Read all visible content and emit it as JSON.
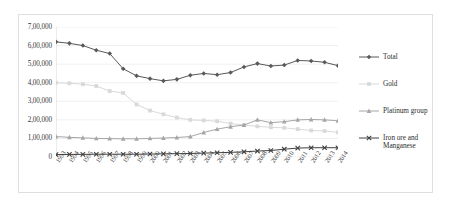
{
  "chart_data": {
    "type": "line",
    "title": "",
    "xlabel": "",
    "ylabel": "",
    "ylim": [
      0,
      700000
    ],
    "grid": true,
    "legend_position": "right",
    "number_format": "indian-lakh",
    "categories": [
      "1993",
      "1994",
      "1995",
      "1996",
      "1997",
      "1998",
      "1999",
      "2000",
      "2001",
      "2002",
      "2003",
      "2004",
      "2005",
      "2006",
      "2007",
      "2008",
      "2009",
      "2010",
      "2011",
      "2012",
      "2013",
      "2014"
    ],
    "ytick_labels": [
      "7,00,000",
      "6,00,000",
      "5,00,000",
      "4,00,000",
      "3,00,000",
      "2,00,000",
      "1,00,000",
      "0"
    ],
    "ytick_values": [
      700000,
      600000,
      500000,
      400000,
      300000,
      200000,
      100000,
      0
    ],
    "series": [
      {
        "name": "Total",
        "color": "#595959",
        "marker": "diamond",
        "values": [
          620000,
          612000,
          600000,
          575000,
          557000,
          475000,
          437000,
          422000,
          410000,
          418000,
          440000,
          450000,
          443000,
          455000,
          485000,
          503000,
          490000,
          495000,
          520000,
          517000,
          510000,
          492000
        ]
      },
      {
        "name": "Gold",
        "color": "#d9d9d9",
        "marker": "square",
        "values": [
          400000,
          397000,
          392000,
          382000,
          355000,
          345000,
          283000,
          250000,
          230000,
          212000,
          200000,
          197000,
          193000,
          180000,
          172000,
          165000,
          160000,
          157000,
          150000,
          143000,
          140000,
          133000
        ]
      },
      {
        "name": "Platinum group",
        "color": "#a6a6a6",
        "marker": "triangle",
        "values": [
          110000,
          106000,
          103000,
          100000,
          99000,
          98000,
          98000,
          100000,
          102000,
          105000,
          110000,
          132000,
          150000,
          163000,
          172000,
          200000,
          185000,
          190000,
          200000,
          202000,
          200000,
          195000
        ]
      },
      {
        "name": "Iron ore and\nManganese",
        "color": "#404040",
        "marker": "cross",
        "values": [
          13000,
          14000,
          14000,
          15000,
          15000,
          15000,
          15000,
          16000,
          17000,
          18000,
          19000,
          21000,
          23000,
          25000,
          28000,
          32000,
          35000,
          42000,
          48000,
          50000,
          50000,
          50000
        ]
      }
    ]
  },
  "legend": {
    "items": [
      {
        "label": "Total"
      },
      {
        "label": "Gold"
      },
      {
        "label": "Platinum group"
      },
      {
        "label": "Iron ore and\nManganese"
      }
    ]
  }
}
